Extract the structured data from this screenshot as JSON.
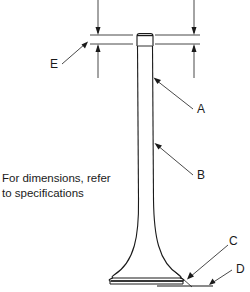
{
  "figure": {
    "type": "engine valve dimension diagram",
    "callouts": {
      "A": "A",
      "B": "B",
      "C": "C",
      "D": "D",
      "E": "E"
    },
    "note_line1": "For dimensions, refer",
    "note_line2": "to specifications"
  },
  "colors": {
    "line": "#1a1a1a",
    "background": "#ffffff"
  }
}
